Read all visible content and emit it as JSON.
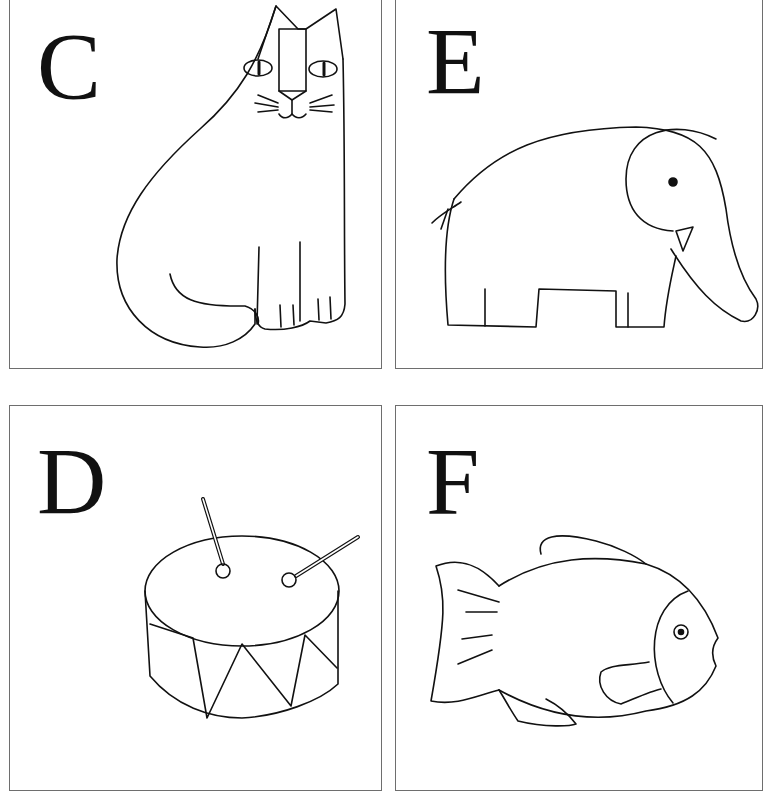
{
  "cards": [
    {
      "letter": "C",
      "picture": "cat"
    },
    {
      "letter": "E",
      "picture": "elephant"
    },
    {
      "letter": "D",
      "picture": "drum"
    },
    {
      "letter": "F",
      "picture": "fish"
    }
  ],
  "colors": {
    "stroke": "#111111",
    "border": "#6e6e6e",
    "background": "#ffffff"
  }
}
